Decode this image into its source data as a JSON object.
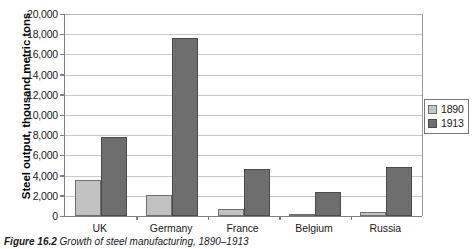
{
  "chart_data": {
    "type": "bar",
    "title": "",
    "xlabel": "",
    "ylabel": "Steel output, thousand metric tons",
    "categories": [
      "UK",
      "Germany",
      "France",
      "Belgium",
      "Russia"
    ],
    "series": [
      {
        "name": "1890",
        "color": "#c2c2c2",
        "values": [
          3600,
          2100,
          700,
          200,
          400
        ]
      },
      {
        "name": "1913",
        "color": "#6e6e6e",
        "values": [
          7800,
          17600,
          4700,
          2400,
          4900
        ]
      }
    ],
    "ylim": [
      0,
      20000
    ],
    "ystep": 2000,
    "ytick_labels": [
      "0",
      "2,000",
      "4,000",
      "6,000",
      "8,000",
      "10,000",
      "12,000",
      "14,000",
      "16,000",
      "18,000",
      "20,000"
    ],
    "grid": true,
    "legend_position": "right"
  },
  "legend": {
    "entries": [
      {
        "label": "1890"
      },
      {
        "label": "1913"
      }
    ]
  },
  "caption": {
    "number": "Figure 16.2",
    "text": "Growth of steel manufacturing, 1890–1913"
  }
}
